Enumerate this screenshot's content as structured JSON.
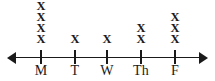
{
  "chart_data": {
    "type": "dot-plot",
    "title": "",
    "subtitle": "",
    "xlabel": "",
    "ylabel": "",
    "mark_glyph": "X",
    "axis": {
      "orientation": "horizontal",
      "left_arrow": true,
      "right_arrow": true,
      "grid": false
    },
    "legend": {
      "present": false,
      "entries": []
    },
    "categories": [
      "M",
      "T",
      "W",
      "Th",
      "F"
    ],
    "values": [
      4,
      1,
      1,
      2,
      3
    ],
    "points": [
      {
        "label": "M",
        "count": 4,
        "tick_x": 41
      },
      {
        "label": "T",
        "count": 1,
        "tick_x": 75
      },
      {
        "label": "W",
        "count": 1,
        "tick_x": 107
      },
      {
        "label": "Th",
        "count": 2,
        "tick_x": 141
      },
      {
        "label": "F",
        "count": 3,
        "tick_x": 175
      }
    ],
    "colors": {
      "ink": "#1a1a1a",
      "background": "#ffffff"
    }
  }
}
